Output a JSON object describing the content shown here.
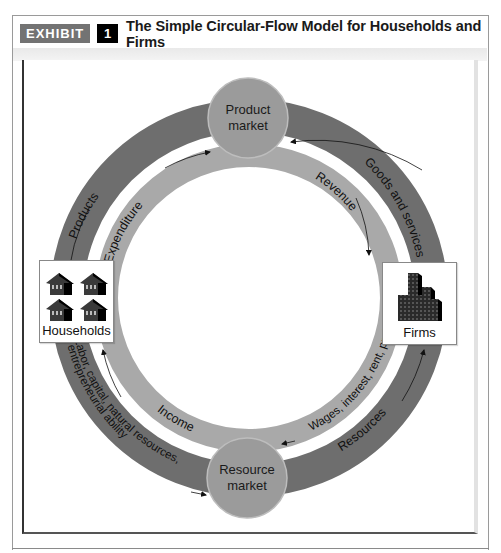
{
  "header": {
    "exhibit_label": "EXHIBIT",
    "exhibit_number": "1",
    "title": "The Simple Circular-Flow Model for Households and Firms"
  },
  "nodes": {
    "product_market": {
      "line1": "Product",
      "line2": "market"
    },
    "resource_market": {
      "line1": "Resource",
      "line2": "market"
    },
    "households": {
      "label": "Households",
      "icon": "houses-icon"
    },
    "firms": {
      "label": "Firms",
      "icon": "buildings-icon"
    }
  },
  "flows": {
    "outer": {
      "products": "Products",
      "goods_and_services": "Goods and services",
      "labor_line1": "Labor, capital, natural resources,",
      "labor_line2": "entrepreneurial ability",
      "resources": "Resources"
    },
    "inner": {
      "expenditure": "Expenditure",
      "revenue": "Revenue",
      "income": "Income",
      "wages": "Wages, interest, rent, profit"
    }
  },
  "colors": {
    "outer_band": "#6e6e6e",
    "inner_band": "#a9a9a9",
    "market_circle": "#9b9b9b",
    "exhibit_bg": "#737373"
  }
}
